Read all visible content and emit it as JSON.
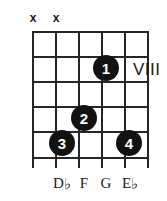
{
  "diagram": {
    "type": "guitar-chord-diagram",
    "position_marker": "VIII",
    "strings_count": 6,
    "frets_count": 5,
    "string_x": [
      33,
      56,
      79,
      102,
      125,
      148
    ],
    "fret_y": [
      31,
      56,
      81,
      106,
      131,
      157
    ],
    "mutes": [
      {
        "string": 1,
        "symbol": "x"
      },
      {
        "string": 2,
        "symbol": "x"
      }
    ],
    "dots": [
      {
        "finger": "1",
        "string": 4,
        "fret": 2,
        "x": 106,
        "y": 68
      },
      {
        "finger": "2",
        "string": 3,
        "fret": 4,
        "x": 84,
        "y": 118
      },
      {
        "finger": "3",
        "string": 2,
        "fret": 5,
        "x": 62,
        "y": 143
      },
      {
        "finger": "4",
        "string": 6,
        "fret": 5,
        "x": 129,
        "y": 143
      }
    ],
    "note_labels": [
      {
        "letter": "D",
        "accidental": "♭",
        "x": 62
      },
      {
        "letter": "F",
        "accidental": "",
        "x": 84
      },
      {
        "letter": "G",
        "accidental": "",
        "x": 106
      },
      {
        "letter": "E",
        "accidental": "♭",
        "x": 129
      }
    ]
  }
}
